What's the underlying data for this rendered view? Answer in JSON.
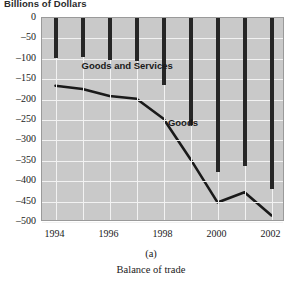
{
  "figure": {
    "axis_title": "Billions of Dollars",
    "caption_label": "(a)",
    "caption_text": "Balance of trade"
  },
  "series_labels": {
    "goods_and_services": "Goods and Services",
    "goods": "Goods"
  },
  "colors": {
    "plot_background": "#c9c9c9",
    "gridline": "#f2f2f2",
    "bar": "#262626",
    "line": "#1a1a1a",
    "axis": "#9a9a9a",
    "text": "#1a1a1a"
  },
  "chart_data": {
    "type": "bar",
    "title": "Billions of Dollars",
    "subtitle": "Balance of trade",
    "xlabel": "",
    "ylabel": "Billions of Dollars",
    "ylim": [
      -500,
      0
    ],
    "xlim": [
      1993.5,
      2002.5
    ],
    "grid": true,
    "legend": "inline annotations",
    "y_ticks": [
      0,
      -50,
      -100,
      -150,
      -200,
      -250,
      -300,
      -350,
      -400,
      -450,
      -500
    ],
    "y_tick_labels": [
      "0",
      "-50",
      "-100",
      "-150",
      "-200",
      "-250",
      "-300",
      "-350",
      "-400",
      "-450",
      "-500"
    ],
    "x_ticks": [
      1994,
      1996,
      1998,
      2000,
      2002
    ],
    "x_tick_labels": [
      "1994",
      "1996",
      "1998",
      "2000",
      "2002"
    ],
    "categories": [
      1994,
      1995,
      1996,
      1997,
      1998,
      1999,
      2000,
      2001,
      2002
    ],
    "series": [
      {
        "name": "Goods and Services",
        "render": "bar",
        "x": [
          1994,
          1995,
          1996,
          1997,
          1998,
          1999,
          2000,
          2001,
          2002
        ],
        "values": [
          -98,
          -96,
          -104,
          -105,
          -165,
          -263,
          -378,
          -362,
          -418
        ]
      },
      {
        "name": "Goods",
        "render": "line",
        "x": [
          1994,
          1995,
          1996,
          1997,
          1998,
          1999,
          2000,
          2001,
          2002
        ],
        "values": [
          -166,
          -174,
          -191,
          -198,
          -247,
          -346,
          -452,
          -427,
          -484
        ]
      }
    ],
    "annotations": [
      {
        "text": "Goods and Services",
        "x": 1995.0,
        "y": -120
      },
      {
        "text": "Goods",
        "x": 1998.2,
        "y": -260
      }
    ]
  }
}
